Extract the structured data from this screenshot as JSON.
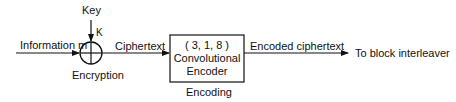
{
  "diagram": {
    "type": "block-diagram",
    "nodes": {
      "key": {
        "label": "Key"
      },
      "key_symbol": {
        "label": "K"
      },
      "xor": {
        "label": "Encryption",
        "symbol": "circle-plus"
      },
      "encoder": {
        "params": "( 3, 1, 8 )",
        "line1": "Convolutional",
        "line2": "Encoder",
        "caption": "Encoding"
      },
      "output": {
        "label": "To block interleaver"
      }
    },
    "edges": {
      "input": {
        "label": "Information m"
      },
      "cipher": {
        "label": "Ciphertext"
      },
      "encoded": {
        "label": "Encoded ciphertext"
      }
    }
  }
}
